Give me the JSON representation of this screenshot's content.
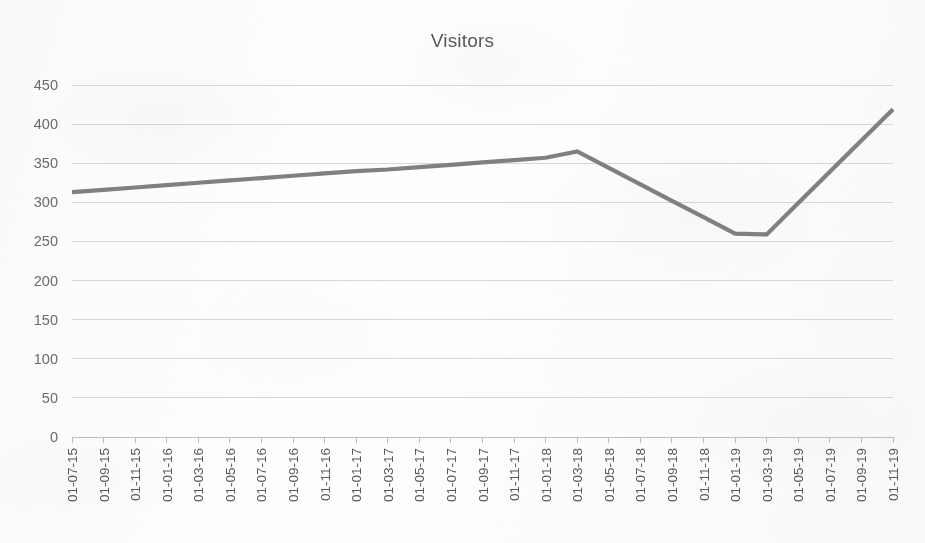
{
  "chart_data": {
    "type": "line",
    "title": "Visitors",
    "xlabel": "",
    "ylabel": "",
    "grid": "horizontal",
    "legend": "none",
    "ylim": [
      0,
      450
    ],
    "ytick_step": 50,
    "ytick_labels": [
      "450",
      "400",
      "350",
      "300",
      "250",
      "200",
      "150",
      "100",
      "50",
      "0"
    ],
    "ytick_values": [
      450,
      400,
      350,
      300,
      250,
      200,
      150,
      100,
      50,
      0
    ],
    "categories": [
      "01-07-15",
      "01-09-15",
      "01-11-15",
      "01-01-16",
      "01-03-16",
      "01-05-16",
      "01-07-16",
      "01-09-16",
      "01-11-16",
      "01-01-17",
      "01-03-17",
      "01-05-17",
      "01-07-17",
      "01-09-17",
      "01-11-17",
      "01-01-18",
      "01-03-18",
      "01-05-18",
      "01-07-18",
      "01-09-18",
      "01-11-18",
      "01-01-19",
      "01-03-19",
      "01-05-19",
      "01-07-19",
      "01-09-19",
      "01-11-19"
    ],
    "series": [
      {
        "name": "Visitors",
        "color": "#808080",
        "values": [
          313,
          316,
          319,
          322,
          325,
          328,
          331,
          334,
          337,
          340,
          342,
          345,
          348,
          351,
          354,
          357,
          365,
          344,
          323,
          302,
          281,
          260,
          259,
          299,
          339,
          379,
          419
        ]
      }
    ],
    "vertices": [
      {
        "category": "01-07-15",
        "value": 313
      },
      {
        "category": "01-03-18",
        "value": 365
      },
      {
        "category": "01-03-19",
        "value": 259
      },
      {
        "category": "01-11-19",
        "value": 419
      }
    ],
    "colors": {
      "line": "#808080",
      "gridline": "#d6d6d6",
      "axis": "#bdbdbd",
      "title_text": "#58595b",
      "tick_text": "#59595b",
      "background": "#fefefe"
    }
  }
}
